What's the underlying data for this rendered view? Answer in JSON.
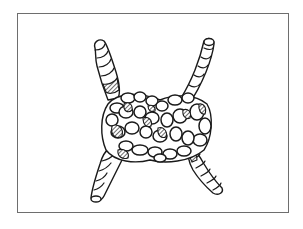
{
  "figure": {
    "frame_color": "#6e6e6e",
    "ink_color": "#1a1a1a",
    "background": "#ffffff",
    "rope_ends": [
      "top-left",
      "top-right",
      "bottom-left",
      "bottom-right"
    ]
  }
}
